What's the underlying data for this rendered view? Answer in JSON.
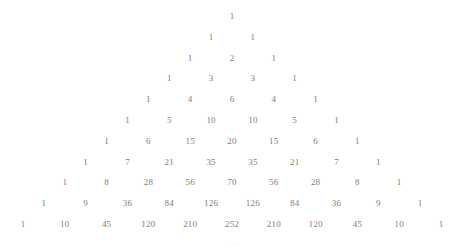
{
  "figure": {
    "kind": "pascals-triangle",
    "width": 470,
    "height": 251,
    "background_color": "#ffffff",
    "text_color": "#7d7d7d",
    "ellipsis_color": "#e0e0e0",
    "center_x": 232,
    "apex_y": 16,
    "row_spacing": 20.8,
    "half_column_spacing": 20.9,
    "ellipsis": "···",
    "ellipsis_x": 234,
    "ellipsis_y": 244
  },
  "chart_data": {
    "type": "table",
    "title": "",
    "subtitle": "",
    "xlabel": "",
    "ylabel": "",
    "legend": [],
    "grid": false,
    "rows": [
      {
        "n": 0,
        "values": [
          1
        ]
      },
      {
        "n": 1,
        "values": [
          1,
          1
        ]
      },
      {
        "n": 2,
        "values": [
          1,
          2,
          1
        ]
      },
      {
        "n": 3,
        "values": [
          1,
          3,
          3,
          1
        ]
      },
      {
        "n": 4,
        "values": [
          1,
          4,
          6,
          4,
          1
        ]
      },
      {
        "n": 5,
        "values": [
          1,
          5,
          10,
          10,
          5,
          1
        ]
      },
      {
        "n": 6,
        "values": [
          1,
          6,
          15,
          20,
          15,
          6,
          1
        ]
      },
      {
        "n": 7,
        "values": [
          1,
          7,
          21,
          35,
          35,
          21,
          7,
          1
        ]
      },
      {
        "n": 8,
        "values": [
          1,
          8,
          28,
          56,
          70,
          56,
          28,
          8,
          1
        ]
      },
      {
        "n": 9,
        "values": [
          1,
          9,
          36,
          84,
          126,
          126,
          84,
          36,
          9,
          1
        ]
      },
      {
        "n": 10,
        "values": [
          1,
          10,
          45,
          120,
          210,
          252,
          210,
          120,
          45,
          10,
          1
        ]
      }
    ]
  }
}
